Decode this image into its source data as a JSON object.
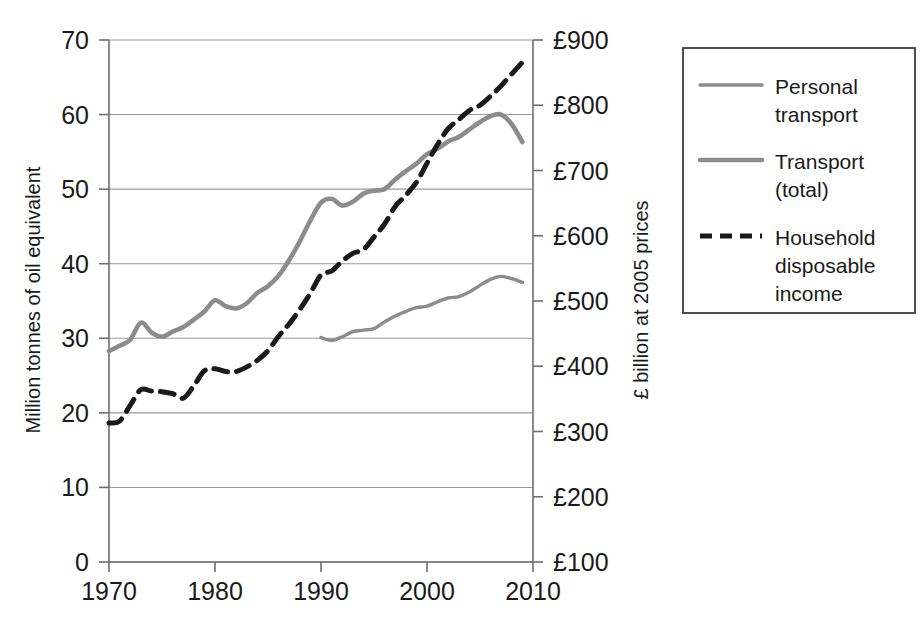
{
  "chart_data": {
    "type": "line",
    "title": "",
    "xlabel": "",
    "ylabel": "Million tonnes of oil equivalent",
    "y2label": "£ billion at 2005 prices",
    "xlim": [
      1970,
      2010
    ],
    "ylim": [
      0,
      70
    ],
    "y2lim": [
      100,
      900
    ],
    "grid": true,
    "legend_position": "right-outside",
    "xticks": [
      "1970",
      "1980",
      "1990",
      "2000",
      "2010"
    ],
    "xtick_values": [
      1970,
      1980,
      1990,
      2000,
      2010
    ],
    "yticks": [
      "0",
      "10",
      "20",
      "30",
      "40",
      "50",
      "60",
      "70"
    ],
    "ytick_values": [
      0,
      10,
      20,
      30,
      40,
      50,
      60,
      70
    ],
    "y2ticks": [
      "£100",
      "£200",
      "£300",
      "£400",
      "£500",
      "£600",
      "£700",
      "£800",
      "£900"
    ],
    "y2tick_values": [
      100,
      200,
      300,
      400,
      500,
      600,
      700,
      800,
      900
    ],
    "series": [
      {
        "name": "Personal transport",
        "axis": "left",
        "style": "solid",
        "color": "#8c8c8c",
        "width": 3.4,
        "x": [
          1990,
          1991,
          1992,
          1993,
          1994,
          1995,
          1996,
          1997,
          1998,
          1999,
          2000,
          2001,
          2002,
          2003,
          2004,
          2005,
          2006,
          2007,
          2008,
          2009
        ],
        "values": [
          30.1,
          29.7,
          30.2,
          30.9,
          31.1,
          31.3,
          32.2,
          33.0,
          33.6,
          34.1,
          34.3,
          34.9,
          35.4,
          35.6,
          36.2,
          37.1,
          37.9,
          38.3,
          38.0,
          37.5
        ]
      },
      {
        "name": "Transport (total)",
        "axis": "left",
        "style": "solid",
        "color": "#8c8c8c",
        "width": 4.6,
        "x": [
          1970,
          1971,
          1972,
          1973,
          1974,
          1975,
          1976,
          1977,
          1978,
          1979,
          1980,
          1981,
          1982,
          1983,
          1984,
          1985,
          1986,
          1987,
          1988,
          1989,
          1990,
          1991,
          1992,
          1993,
          1994,
          1995,
          1996,
          1997,
          1998,
          1999,
          2000,
          2001,
          2002,
          2003,
          2004,
          2005,
          2006,
          2007,
          2008,
          2009
        ],
        "values": [
          28.3,
          29.0,
          29.8,
          32.1,
          30.8,
          30.2,
          30.9,
          31.5,
          32.5,
          33.6,
          35.1,
          34.3,
          34.0,
          34.7,
          36.1,
          37.0,
          38.4,
          40.5,
          43.0,
          45.8,
          48.2,
          48.7,
          47.8,
          48.3,
          49.4,
          49.8,
          50.0,
          51.3,
          52.4,
          53.4,
          54.7,
          55.4,
          56.4,
          57.0,
          58.0,
          59.0,
          59.8,
          60.0,
          58.7,
          56.3
        ]
      },
      {
        "name": "Household disposable income",
        "axis": "right",
        "style": "dashed",
        "color": "#1a1a1a",
        "width": 5.0,
        "x": [
          1970,
          1971,
          1972,
          1973,
          1974,
          1975,
          1976,
          1977,
          1978,
          1979,
          1980,
          1981,
          1982,
          1983,
          1984,
          1985,
          1986,
          1987,
          1988,
          1989,
          1990,
          1991,
          1992,
          1993,
          1994,
          1995,
          1996,
          1997,
          1998,
          1999,
          2000,
          2001,
          2002,
          2003,
          2004,
          2005,
          2006,
          2007,
          2008,
          2009
        ],
        "values": [
          313,
          316,
          340,
          364,
          362,
          361,
          358,
          351,
          370,
          393,
          396,
          392,
          392,
          399,
          409,
          424,
          446,
          465,
          487,
          512,
          540,
          546,
          561,
          573,
          579,
          598,
          618,
          645,
          662,
          682,
          711,
          740,
          764,
          778,
          792,
          800,
          814,
          830,
          848,
          866
        ]
      }
    ]
  },
  "legend": {
    "entries": [
      {
        "label_line1": "Personal",
        "label_line2": "transport",
        "label_line3": ""
      },
      {
        "label_line1": "Transport",
        "label_line2": "(total)",
        "label_line3": ""
      },
      {
        "label_line1": "Household",
        "label_line2": "disposable",
        "label_line3": "income"
      }
    ]
  },
  "colors": {
    "grey_series": "#8c8c8c",
    "dashed_series": "#1a1a1a",
    "gridline": "#9a9a9a",
    "axis": "#6e6e6e",
    "legend_border": "#3c3c3c",
    "background": "#ffffff"
  }
}
